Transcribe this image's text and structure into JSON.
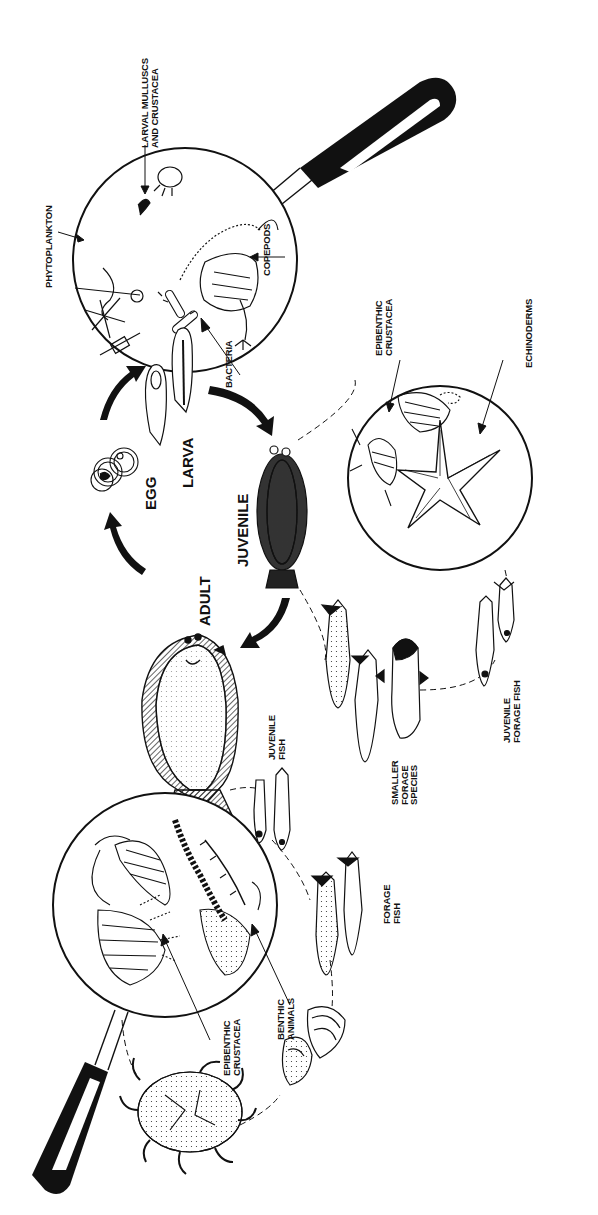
{
  "diagram": {
    "type": "life-cycle and food-web illustration (rotated 90°)",
    "colors": {
      "ink": "#111111",
      "background": "#ffffff"
    },
    "life_stages": [
      {
        "id": "egg",
        "label": "EGG"
      },
      {
        "id": "larva",
        "label": "LARVA"
      },
      {
        "id": "juvenile",
        "label": "JUVENILE"
      },
      {
        "id": "adult",
        "label": "ADULT"
      }
    ],
    "cycle_arrows": [
      {
        "from": "adult",
        "to": "egg"
      },
      {
        "from": "egg",
        "to": "larva"
      },
      {
        "from": "larva",
        "to": "juvenile"
      },
      {
        "from": "juvenile",
        "to": "adult"
      }
    ],
    "magnifiers": {
      "larval_diet": {
        "labels": {
          "larval_molluscs": [
            "LARVAL  MULLUSCS",
            "AND  CRUSTACEA"
          ],
          "phytoplankton": "PHYTOPLANKTON",
          "copepods": "COPEPODS",
          "bacteria": "BACTERIA"
        }
      },
      "juvenile_diet": {
        "labels": {
          "epibenthic_crustacea": [
            "EPIBENTHIC",
            "CRUSTACEA"
          ],
          "echinoderms": "ECHINODERMS"
        }
      },
      "adult_diet": {
        "labels": {
          "epibenthic_crustacea": [
            "EPIBENTHIC",
            "CRUSTACEA"
          ],
          "benthic_animals": [
            "BENTHIC",
            "ANIMALS"
          ]
        }
      }
    },
    "prey_groups": {
      "smaller_forage_species": [
        "SMALLER",
        "FORAGE",
        "SPECIES"
      ],
      "juvenile_forage_fish": [
        "JUVENILE",
        "FORAGE  FISH"
      ],
      "juvenile_fish": [
        "JUVENILE",
        "FISH"
      ],
      "forage_fish": [
        "FORAGE",
        "FISH"
      ]
    }
  }
}
